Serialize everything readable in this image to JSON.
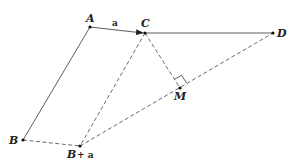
{
  "diagram": {
    "points": {
      "A": {
        "label": "A",
        "x": 90,
        "y": 27
      },
      "C": {
        "label": "C",
        "x": 145,
        "y": 33
      },
      "D": {
        "label": "D",
        "x": 273,
        "y": 33
      },
      "M": {
        "label": "M",
        "x": 180,
        "y": 88
      },
      "B": {
        "label": "B",
        "x": 23,
        "y": 140
      },
      "Ba": {
        "label": "B",
        "suffix": "+ a",
        "x": 80,
        "y": 146
      }
    },
    "vector_label": "a",
    "segments": [
      {
        "from": "A",
        "to": "C",
        "style": "solid",
        "arrow": true
      },
      {
        "from": "C",
        "to": "D",
        "style": "solid"
      },
      {
        "from": "A",
        "to": "B",
        "style": "solid"
      },
      {
        "from": "C",
        "to": "Ba",
        "style": "dashed"
      },
      {
        "from": "C",
        "to": "M",
        "style": "dashed"
      },
      {
        "from": "Ba",
        "to": "D",
        "style": "dashed"
      },
      {
        "from": "B",
        "to": "Ba",
        "style": "dashed"
      }
    ],
    "right_angle_at": "M"
  }
}
